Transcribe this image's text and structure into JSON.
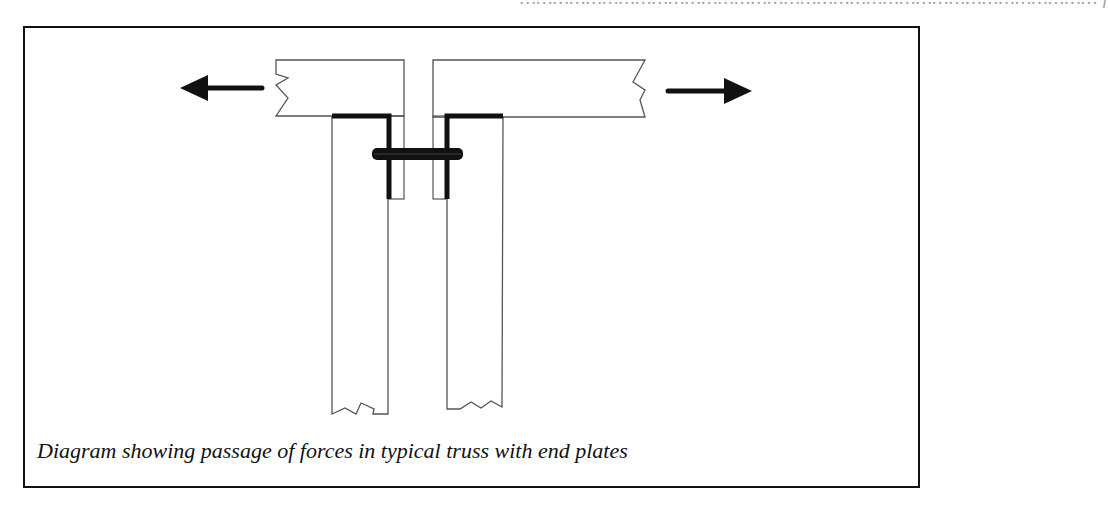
{
  "page": {
    "top_fragment": "…………………………………………………………………………………………… f",
    "caption": "Diagram showing passage of forces in typical truss with end plates"
  },
  "diagram": {
    "elements": [
      {
        "name": "left-force-arrow",
        "direction": "left"
      },
      {
        "name": "right-force-arrow",
        "direction": "right"
      },
      {
        "name": "left-horizontal-member"
      },
      {
        "name": "right-horizontal-member"
      },
      {
        "name": "left-vertical-member"
      },
      {
        "name": "right-vertical-member"
      },
      {
        "name": "left-end-plate"
      },
      {
        "name": "right-end-plate"
      },
      {
        "name": "bolt"
      }
    ],
    "colors": {
      "line": "#555555",
      "heavy": "#111111",
      "background": "#ffffff"
    }
  }
}
